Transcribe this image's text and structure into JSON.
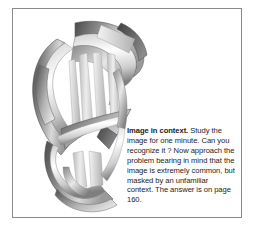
{
  "panel": {
    "frame_color": "#8a8a8a",
    "background": "#ffffff"
  },
  "caption": {
    "lead_label": "Image in context.",
    "body_text": " Study the image for one minute. Can you recognize it ? Now approach the problem bearing in mind that the image is extremely common, but masked by an unfamiliar context. The answer is on page 160.",
    "lines": [
      "Image in context. Study",
      "the image for one minute.",
      "Can you recognize it ?",
      "Now approach the problem",
      "bearing in mind that the",
      "image is extremely",
      "common, but masked by",
      "an unfamiliar context. The",
      "answer is on page 160."
    ],
    "answer_page_number": "160"
  },
  "illustration": {
    "name": "interwoven-ribbon-puzzle-figure",
    "description": "Grayscale airbrushed drawing of interlaced curling ribbons forming an unfamiliar shape",
    "palette": {
      "white": "#ffffff",
      "light_gray": "#e3e3e3",
      "mid_gray": "#b8b8b8",
      "dark_gray": "#6e6e6e",
      "darkest_gray": "#4a4a4a",
      "outline": "#555555"
    }
  }
}
